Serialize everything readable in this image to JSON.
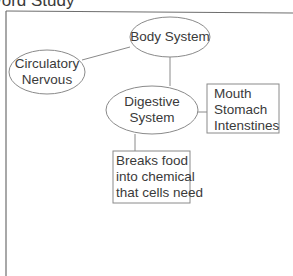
{
  "header": {
    "title": "Word Study"
  },
  "diagram": {
    "nodes": {
      "body_system": {
        "shape": "ellipse",
        "lines": [
          "Body System"
        ]
      },
      "circulatory_nervous": {
        "shape": "ellipse",
        "lines": [
          "Circulatory",
          "Nervous"
        ]
      },
      "digestive_system": {
        "shape": "ellipse",
        "lines": [
          "Digestive",
          "System"
        ]
      },
      "organs": {
        "shape": "rectangle",
        "lines": [
          "Mouth",
          "Stomach",
          "Intenstines"
        ]
      },
      "function": {
        "shape": "rectangle",
        "lines": [
          "Breaks food",
          "into chemical",
          "that cells need"
        ]
      }
    },
    "edges": [
      {
        "from": "body_system",
        "to": "circulatory_nervous"
      },
      {
        "from": "body_system",
        "to": "digestive_system"
      },
      {
        "from": "digestive_system",
        "to": "organs"
      },
      {
        "from": "digestive_system",
        "to": "function"
      }
    ],
    "colors": {
      "stroke": "#8a8a8a",
      "frame": "#6e6e6e",
      "text": "#3a3a3a"
    }
  }
}
